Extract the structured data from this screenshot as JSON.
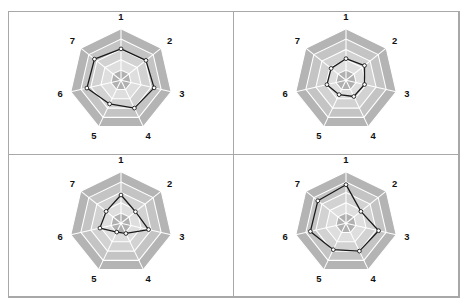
{
  "figure": {
    "cut_off_title": "· ·· ··",
    "panel_count": 4,
    "layout": "2x2 grid of radar charts",
    "border_color": "#a8a8a8",
    "background": "#ffffff"
  },
  "style": {
    "ring_colors": [
      "#b4b4b4",
      "#c4c4c4",
      "#d2d2d2",
      "#dedede",
      "#b0b0b0"
    ],
    "grid_color": "#ffffff",
    "series_color": "#1a1a1a",
    "marker_fill": "#ffffff",
    "label_color": "#111111"
  },
  "chart_data": [
    {
      "type": "radar",
      "panel": "top-left",
      "title": "",
      "categories": [
        "1",
        "2",
        "3",
        "4",
        "5",
        "6",
        "7"
      ],
      "axis_labels": [
        "1",
        "2",
        "3",
        "4",
        "5",
        "6",
        "7"
      ],
      "rlim": [
        0,
        5
      ],
      "rings": 5,
      "grid": true,
      "legend": "none",
      "series": [
        {
          "name": "series-1",
          "values": [
            3.05,
            3.1,
            3.3,
            3.0,
            2.55,
            3.4,
            3.3
          ]
        }
      ]
    },
    {
      "type": "radar",
      "panel": "top-right",
      "title": "",
      "categories": [
        "1",
        "2",
        "3",
        "4",
        "5",
        "6",
        "7"
      ],
      "axis_labels": [
        "1",
        "2",
        "3",
        "4",
        "5",
        "6",
        "7"
      ],
      "rlim": [
        0,
        5
      ],
      "rings": 5,
      "grid": true,
      "legend": "none",
      "series": [
        {
          "name": "series-2",
          "values": [
            2.1,
            2.3,
            1.85,
            1.75,
            1.55,
            1.9,
            1.85
          ]
        }
      ]
    },
    {
      "type": "radar",
      "panel": "bottom-left",
      "title": "",
      "categories": [
        "1",
        "2",
        "3",
        "4",
        "5",
        "6",
        "7"
      ],
      "axis_labels": [
        "1",
        "2",
        "3",
        "4",
        "5",
        "6",
        "7"
      ],
      "rlim": [
        0,
        5
      ],
      "rings": 5,
      "grid": true,
      "legend": "none",
      "series": [
        {
          "name": "series-3",
          "values": [
            2.75,
            1.8,
            2.75,
            1.1,
            0.95,
            2.1,
            1.85
          ]
        }
      ]
    },
    {
      "type": "radar",
      "panel": "bottom-right",
      "title": "",
      "categories": [
        "1",
        "2",
        "3",
        "4",
        "5",
        "6",
        "7"
      ],
      "axis_labels": [
        "1",
        "2",
        "3",
        "4",
        "5",
        "6",
        "7"
      ],
      "rlim": [
        0,
        5
      ],
      "rings": 5,
      "grid": true,
      "legend": "none",
      "series": [
        {
          "name": "series-4",
          "values": [
            3.75,
            1.85,
            3.25,
            3.0,
            2.85,
            3.55,
            3.5
          ]
        }
      ]
    }
  ]
}
